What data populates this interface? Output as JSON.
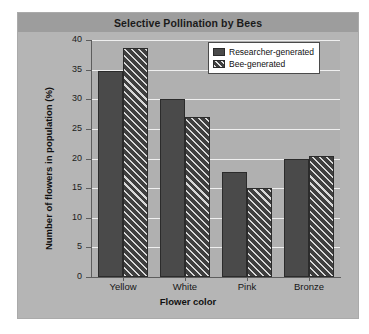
{
  "chart_data": {
    "type": "bar",
    "title": "Selective Pollination by Bees",
    "xlabel": "Flower color",
    "ylabel": "Number of flowers in population (%)",
    "categories": [
      "Yellow",
      "White",
      "Pink",
      "Bronze"
    ],
    "series": [
      {
        "name": "Researcher-generated",
        "fill": "solid",
        "values": [
          34.7,
          30.1,
          17.7,
          19.9
        ]
      },
      {
        "name": "Bee-generated",
        "fill": "hatched-diagonal",
        "values": [
          38.7,
          27.0,
          15.1,
          20.4
        ]
      }
    ],
    "ylim": [
      0,
      40
    ],
    "yticks": [
      0,
      5,
      10,
      15,
      20,
      25,
      30,
      35,
      40
    ],
    "ytick_labels": [
      "0",
      "5",
      "10",
      "15",
      "20",
      "25",
      "30",
      "35",
      "40"
    ],
    "grid": true,
    "legend_position": "top-right",
    "colors": {
      "bar_solid": "#4a4a4a",
      "bar_hatch": "#3f3f3f",
      "bar_edge": "#2b2b2b",
      "panel_background": "#b5b5b5",
      "plot_background": "#b0b0b0",
      "title_band": "#9d9d9d",
      "gridline": "#efefef",
      "axis": "#5d5d5d",
      "text": "#111111",
      "legend_background": "#ffffff"
    }
  }
}
